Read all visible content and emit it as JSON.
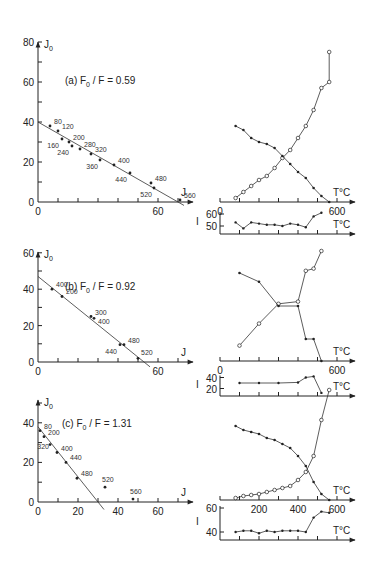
{
  "chart_data": [
    {
      "type": "scatter",
      "panel": "a-left",
      "title": "(a) F0/F = 0.59",
      "xlabel": "J",
      "ylabel": "J0",
      "xlim": [
        0,
        75
      ],
      "ylim": [
        0,
        80
      ],
      "xticks": [
        0,
        60
      ],
      "yticks": [
        0,
        20,
        40,
        60,
        80
      ],
      "fit_line": {
        "x": [
          0,
          70
        ],
        "y": [
          40,
          0
        ]
      },
      "points": [
        {
          "label": "80",
          "x": 6,
          "y": 38
        },
        {
          "label": "120",
          "x": 10,
          "y": 35.5
        },
        {
          "label": "160",
          "x": 12,
          "y": 31.5
        },
        {
          "label": "200",
          "x": 15.5,
          "y": 30
        },
        {
          "label": "240",
          "x": 17,
          "y": 28
        },
        {
          "label": "280",
          "x": 21,
          "y": 26.5
        },
        {
          "label": "320",
          "x": 26.5,
          "y": 24
        },
        {
          "label": "360",
          "x": 31,
          "y": 21
        },
        {
          "label": "400",
          "x": 38,
          "y": 18.5
        },
        {
          "label": "440",
          "x": 46,
          "y": 14.5
        },
        {
          "label": "480",
          "x": 56.5,
          "y": 9.5
        },
        {
          "label": "520",
          "x": 58,
          "y": 7
        },
        {
          "label": "560",
          "x": 71,
          "y": 1
        }
      ]
    },
    {
      "type": "line",
      "panel": "a-right-J",
      "xlabel": "T°C",
      "xticks": [
        0,
        600
      ],
      "xlim": [
        0,
        700
      ],
      "series": [
        {
          "name": "J (open circles)",
          "marker": "open",
          "x": [
            80,
            120,
            160,
            200,
            240,
            280,
            320,
            360,
            400,
            440,
            480,
            520,
            560
          ],
          "y": [
            2,
            5,
            8,
            11,
            13,
            17,
            22,
            26,
            32,
            38,
            46,
            57,
            60
          ]
        },
        {
          "name": "J0 (filled dots)",
          "marker": "filled",
          "x": [
            80,
            120,
            160,
            200,
            240,
            280,
            320,
            360,
            400,
            440,
            480,
            520,
            560
          ],
          "y": [
            38,
            36,
            32,
            30,
            29,
            27,
            23,
            19,
            15,
            12,
            7,
            3,
            0
          ]
        }
      ],
      "open_extra": [
        {
          "x": 560,
          "y": 75
        }
      ]
    },
    {
      "type": "line",
      "panel": "a-right-I",
      "ylabel": "I",
      "xlabel": "T°C",
      "yticks": [
        50,
        60
      ],
      "series": [
        {
          "name": "I",
          "x": [
            80,
            120,
            160,
            200,
            240,
            280,
            320,
            360,
            400,
            440,
            480,
            520
          ],
          "y": [
            53,
            48,
            53,
            52,
            51,
            51,
            50,
            52,
            51,
            49,
            58,
            61
          ]
        }
      ]
    },
    {
      "type": "scatter",
      "panel": "b-left",
      "title": "(b) F0/F = 0.92",
      "xlabel": "J",
      "ylabel": "J0",
      "xlim": [
        0,
        75
      ],
      "ylim": [
        0,
        60
      ],
      "xticks": [
        0,
        60
      ],
      "yticks": [
        0,
        20,
        40,
        60
      ],
      "fit_line": {
        "x": [
          0,
          53
        ],
        "y": [
          47,
          0
        ]
      },
      "points": [
        {
          "label": "400",
          "x": 7,
          "y": 40
        },
        {
          "label": "200",
          "x": 12,
          "y": 36
        },
        {
          "label": "300",
          "x": 26.5,
          "y": 25
        },
        {
          "label": "400",
          "x": 28,
          "y": 24
        },
        {
          "label": "440",
          "x": 41,
          "y": 9.5
        },
        {
          "label": "480",
          "x": 43,
          "y": 9.5
        },
        {
          "label": "520",
          "x": 50,
          "y": 2
        }
      ]
    },
    {
      "type": "line",
      "panel": "b-right-J",
      "xlabel": "T°C",
      "xticks": [
        0,
        600
      ],
      "xlim": [
        0,
        700
      ],
      "series": [
        {
          "name": "J (open circles)",
          "marker": "open",
          "x": [
            100,
            200,
            300,
            400,
            440,
            480,
            520
          ],
          "y": [
            7,
            17,
            26,
            27,
            41,
            42,
            50
          ]
        },
        {
          "name": "J0 (filled dots)",
          "marker": "filled",
          "x": [
            100,
            200,
            300,
            400,
            440,
            480,
            520
          ],
          "y": [
            40,
            36,
            25,
            25,
            10,
            10,
            0
          ]
        }
      ]
    },
    {
      "type": "line",
      "panel": "b-right-I",
      "ylabel": "I",
      "xlabel": "T°C",
      "yticks": [
        20,
        40
      ],
      "series": [
        {
          "name": "I",
          "x": [
            100,
            200,
            300,
            400,
            440,
            480,
            520
          ],
          "y": [
            30,
            30,
            30,
            31,
            40,
            42,
            12
          ]
        }
      ]
    },
    {
      "type": "scatter",
      "panel": "c-left",
      "title": "(c) F0/F = 1.31",
      "xlabel": "J",
      "ylabel": "J0",
      "xlim": [
        0,
        75
      ],
      "ylim": [
        0,
        50
      ],
      "xticks": [
        0,
        20,
        40,
        60
      ],
      "yticks": [
        0,
        20,
        40
      ],
      "fit_line": {
        "x": [
          0,
          30
        ],
        "y": [
          38,
          0
        ]
      },
      "points": [
        {
          "label": "80",
          "x": 1,
          "y": 36
        },
        {
          "label": "200",
          "x": 3,
          "y": 33
        },
        {
          "label": "320",
          "x": 6,
          "y": 29
        },
        {
          "label": "400",
          "x": 9.5,
          "y": 25
        },
        {
          "label": "440",
          "x": 14,
          "y": 20
        },
        {
          "label": "480",
          "x": 19.5,
          "y": 12
        },
        {
          "label": "520",
          "x": 33.5,
          "y": 7.5
        },
        {
          "label": "560",
          "x": 47.5,
          "y": 1.5
        }
      ]
    },
    {
      "type": "line",
      "panel": "c-right-J",
      "xlabel": "T°C",
      "xticks": [
        200,
        400,
        600
      ],
      "xlim": [
        0,
        700
      ],
      "series": [
        {
          "name": "J (open circles)",
          "marker": "open",
          "x": [
            80,
            120,
            160,
            200,
            240,
            280,
            320,
            360,
            400,
            440,
            480,
            520,
            560
          ],
          "y": [
            1,
            2,
            2.5,
            3,
            4,
            5,
            6,
            7,
            10,
            14,
            22,
            40,
            55
          ]
        },
        {
          "name": "J0 (filled dots)",
          "marker": "filled",
          "x": [
            80,
            120,
            160,
            200,
            240,
            280,
            320,
            360,
            400,
            440,
            480,
            520,
            560
          ],
          "y": [
            37,
            35,
            34,
            33,
            31,
            30,
            28,
            26,
            22,
            17,
            9,
            3,
            0
          ]
        }
      ]
    },
    {
      "type": "line",
      "panel": "c-right-I",
      "ylabel": "I",
      "xlabel": "T°C",
      "yticks": [
        40,
        60
      ],
      "series": [
        {
          "name": "I",
          "x": [
            80,
            120,
            160,
            200,
            240,
            280,
            320,
            360,
            400,
            440,
            480,
            520,
            560
          ],
          "y": [
            40,
            41,
            41,
            39,
            41,
            40,
            41,
            41,
            41,
            40,
            52,
            57,
            56
          ]
        }
      ]
    }
  ],
  "labels": {
    "j0_axis": "J",
    "j0_sub": "0",
    "j_axis": "J",
    "t_axis": "T°C",
    "i_axis": "I",
    "title_a_prefix": "(a)",
    "title_a_ratio": "F",
    "title_a_value": "/ F = 0.59",
    "title_b_prefix": "(b)",
    "title_b_value": "/ F = 0.92",
    "title_c_prefix": "(c)",
    "title_c_value": "/ F = 1.31",
    "tick_0": "0",
    "tick_20": "20",
    "tick_40": "40",
    "tick_50": "50",
    "tick_60": "60",
    "tick_80": "80",
    "tick_200": "200",
    "tick_400": "400",
    "tick_600": "600"
  }
}
